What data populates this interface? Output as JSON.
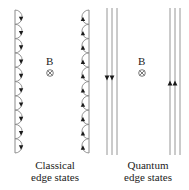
{
  "diagram": {
    "colors": {
      "stroke": "#8a8a8a",
      "arrow": "#1a1a1a",
      "text": "#222222",
      "background": "#ffffff"
    },
    "panels": [
      {
        "id": "classical",
        "field_label": "B",
        "field_symbol": "⊗",
        "field_direction": "into-page",
        "caption_line1": "Classical",
        "caption_line2": "edge states",
        "left_edge": {
          "type": "skipping-orbits",
          "count": 10,
          "bulge": "right",
          "arrow_direction": "down"
        },
        "right_edge": {
          "type": "skipping-orbits",
          "count": 10,
          "bulge": "left",
          "arrow_direction": "up"
        }
      },
      {
        "id": "quantum",
        "field_label": "B",
        "field_symbol": "⊗",
        "field_direction": "into-page",
        "caption_line1": "Quantum",
        "caption_line2": "edge states",
        "left_edge": {
          "type": "parallel-channels",
          "count": 3,
          "arrowed_channels": 2,
          "arrow_direction": "down"
        },
        "right_edge": {
          "type": "parallel-channels",
          "count": 3,
          "arrowed_channels": 2,
          "arrow_direction": "up"
        }
      }
    ]
  }
}
